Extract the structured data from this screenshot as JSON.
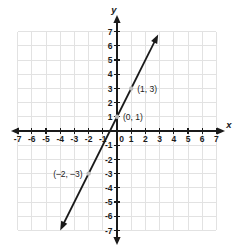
{
  "chart_data": {
    "type": "line",
    "title": "",
    "xlabel": "x",
    "ylabel": "y",
    "xlim": [
      -7,
      7
    ],
    "ylim": [
      -7,
      7
    ],
    "grid": true,
    "legend": "none",
    "equation": "y = 2x + 1",
    "slope": 2,
    "intercept": 1,
    "x_ticks": [
      "-7",
      "-6",
      "-5",
      "-4",
      "-3",
      "-2",
      "-1",
      "0",
      "1",
      "2",
      "3",
      "4",
      "5",
      "6",
      "7"
    ],
    "x_tick_values": [
      -7,
      -6,
      -5,
      -4,
      -3,
      -2,
      -1,
      0,
      1,
      2,
      3,
      4,
      5,
      6,
      7
    ],
    "y_ticks": [
      "7",
      "6",
      "5",
      "4",
      "3",
      "2",
      "1",
      "-1",
      "-2",
      "-3",
      "-4",
      "-5",
      "-6",
      "-7"
    ],
    "y_tick_values": [
      7,
      6,
      5,
      4,
      3,
      2,
      1,
      -1,
      -2,
      -3,
      -4,
      -5,
      -6,
      -7
    ],
    "line_endpoints": {
      "x1": -4.0,
      "y1": -7.0,
      "x2": 2.9,
      "y2": 6.8
    },
    "points": [
      {
        "label": "(1, 3)",
        "x": 1,
        "y": 3,
        "label_side": "right"
      },
      {
        "label": "(0, 1)",
        "x": 0,
        "y": 1,
        "label_side": "right"
      },
      {
        "label": "(–2, –3)",
        "x": -2,
        "y": -3,
        "label_side": "left"
      }
    ],
    "colors": {
      "grid": "#e2e2e2",
      "axis": "#1a1a1a",
      "line": "#1a1a1a",
      "point_dot": "#b8b8b8",
      "background": "#ffffff"
    }
  },
  "axis_labels": {
    "x": "x",
    "y": "y"
  },
  "x_tick_labels": [
    "-7",
    "-6",
    "-5",
    "-4",
    "-3",
    "-2",
    "-1",
    "0",
    "1",
    "2",
    "3",
    "4",
    "5",
    "6",
    "7"
  ],
  "y_tick_labels": [
    "7",
    "6",
    "5",
    "4",
    "3",
    "2",
    "1",
    "-1",
    "-2",
    "-3",
    "-4",
    "-5",
    "-6",
    "-7"
  ],
  "point_labels": {
    "p1": "(1, 3)",
    "p2": "(0, 1)",
    "p3": "(–2, –3)"
  }
}
